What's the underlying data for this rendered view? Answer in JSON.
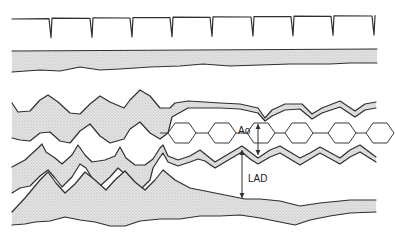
{
  "figure": {
    "type": "M-mode echocardiogram schematic",
    "width": 395,
    "height": 236,
    "colors": {
      "line": "#2e2e2e",
      "stipple_fill": "#d9d9d9",
      "background": "#ffffff"
    }
  },
  "labels": {
    "ao": "Ao",
    "lad": "LAD"
  },
  "ecg": {
    "baseline_y_left": 19,
    "baseline_y_right": 16,
    "x_start": 12,
    "x_end": 374,
    "spike_x": [
      51,
      92,
      132,
      172,
      212,
      253,
      293,
      333,
      374
    ],
    "spike_depth": 19
  },
  "chest_wall_band": {
    "top": [
      [
        12,
        51
      ],
      [
        377,
        49
      ]
    ],
    "bottom": [
      [
        12,
        72
      ],
      [
        40,
        70
      ],
      [
        60,
        71
      ],
      [
        80,
        67
      ],
      [
        100,
        70
      ],
      [
        120,
        69
      ],
      [
        150,
        67
      ],
      [
        180,
        66
      ],
      [
        203,
        64
      ],
      [
        230,
        66
      ],
      [
        260,
        65
      ],
      [
        290,
        64
      ],
      [
        330,
        64
      ],
      [
        350,
        63
      ],
      [
        377,
        63
      ]
    ]
  },
  "ao_annotation": {
    "x": 258,
    "y_top": 124,
    "y_bottom": 155,
    "label_x": 238,
    "label_y": 133
  },
  "lad_annotation": {
    "x": 242,
    "y_top": 150,
    "y_bottom": 198,
    "label_x": 248,
    "label_y": 177
  },
  "hexagons": {
    "y_center": 133,
    "half_height": 10,
    "half_width": 14,
    "bevel": 7,
    "centers_x": [
      182,
      222,
      261,
      299,
      342,
      380
    ],
    "link_y_top": 123,
    "link_y_bottom": 143
  }
}
